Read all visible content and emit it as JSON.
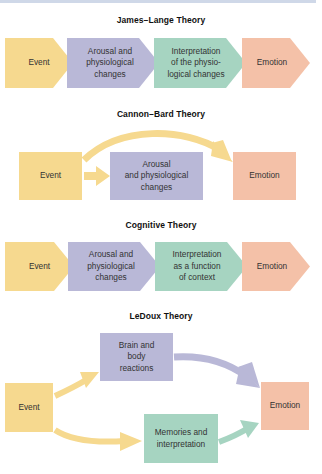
{
  "colors": {
    "event": "#f6d98f",
    "arousal": "#b9b8d7",
    "interpretation": "#a6d4c1",
    "emotion": "#f4c1a8",
    "topbar": "#cfd8e8"
  },
  "theories": [
    {
      "title": "James–Lange Theory",
      "layout": "chevron-chain",
      "steps": [
        {
          "label": "Event"
        },
        {
          "label": "Arousal and physiological changes",
          "lines": [
            "Arousal and",
            "physiological",
            "changes"
          ]
        },
        {
          "label": "Interpretation of the physiological changes",
          "lines": [
            "Interpretation",
            "of the physio-",
            "logical changes"
          ]
        },
        {
          "label": "Emotion"
        }
      ]
    },
    {
      "title": "Cannon–Bard Theory",
      "layout": "parallel-boxes",
      "boxes": [
        {
          "label": "Event"
        },
        {
          "label": "Arousal and physiological changes",
          "lines": [
            "Arousal",
            "and physiological",
            "changes"
          ]
        },
        {
          "label": "Emotion"
        }
      ],
      "arrows": [
        {
          "from": "Event",
          "to": "Arousal and physiological changes"
        },
        {
          "from": "Event",
          "to": "Emotion",
          "style": "curved-over"
        }
      ]
    },
    {
      "title": "Cognitive Theory",
      "layout": "chevron-chain",
      "steps": [
        {
          "label": "Event"
        },
        {
          "label": "Arousal and physiological changes",
          "lines": [
            "Arousal and",
            "physiological",
            "changes"
          ]
        },
        {
          "label": "Interpretation as a function of context",
          "lines": [
            "Interpretation",
            "as a function",
            "of context"
          ]
        },
        {
          "label": "Emotion"
        }
      ]
    },
    {
      "title": "LeDoux Theory",
      "layout": "dual-path",
      "boxes": [
        {
          "label": "Event"
        },
        {
          "label": "Brain and body reactions",
          "lines": [
            "Brain and",
            "body",
            "reactions"
          ]
        },
        {
          "label": "Memories and interpretation",
          "lines": [
            "Memories and",
            "interpretation"
          ]
        },
        {
          "label": "Emotion"
        }
      ],
      "arrows": [
        {
          "from": "Event",
          "to": "Brain and body reactions"
        },
        {
          "from": "Event",
          "to": "Memories and interpretation"
        },
        {
          "from": "Brain and body reactions",
          "to": "Emotion"
        },
        {
          "from": "Memories and interpretation",
          "to": "Emotion"
        }
      ]
    }
  ]
}
